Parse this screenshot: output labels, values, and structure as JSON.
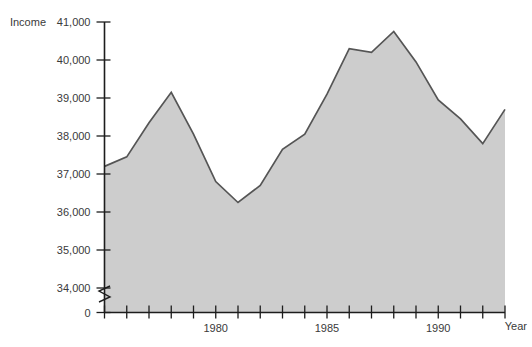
{
  "chart_data": {
    "type": "area",
    "title": "",
    "xlabel": "Year",
    "ylabel": "Income",
    "grid": false,
    "legend": "none",
    "ylim": [
      34000,
      41000
    ],
    "y_axis_break": true,
    "y_break_labels": [
      "0",
      "34,000"
    ],
    "yticks": [
      0,
      34000,
      35000,
      36000,
      37000,
      38000,
      39000,
      40000,
      41000
    ],
    "ytick_labels": [
      "0",
      "34,000",
      "35,000",
      "36,000",
      "37,000",
      "38,000",
      "39,000",
      "40,000",
      "41,000"
    ],
    "xlim": [
      1975,
      1993
    ],
    "xticks": [
      1975,
      1976,
      1977,
      1978,
      1979,
      1980,
      1981,
      1982,
      1983,
      1984,
      1985,
      1986,
      1987,
      1988,
      1989,
      1990,
      1991,
      1992,
      1993
    ],
    "xtick_labels": [
      "",
      "",
      "",
      "",
      "",
      "1980",
      "",
      "",
      "",
      "",
      "1985",
      "",
      "",
      "",
      "",
      "1990",
      "",
      "",
      ""
    ],
    "x": [
      1975,
      1976,
      1977,
      1978,
      1979,
      1980,
      1981,
      1982,
      1983,
      1984,
      1985,
      1986,
      1987,
      1988,
      1989,
      1990,
      1991,
      1992,
      1993
    ],
    "values": [
      37200,
      37450,
      38350,
      39150,
      38050,
      36800,
      36250,
      36700,
      37650,
      38050,
      39100,
      40300,
      40200,
      40750,
      39950,
      38950,
      38450,
      37800,
      38700
    ],
    "series": [
      {
        "name": "Income",
        "values": [
          37200,
          37450,
          38350,
          39150,
          38050,
          36800,
          36250,
          36700,
          37650,
          38050,
          39100,
          40300,
          40200,
          40750,
          39950,
          38950,
          38450,
          37800,
          38700
        ]
      }
    ],
    "colors": {
      "fill": "#cdcdcd",
      "line": "#555555",
      "axis": "#1d1d1d",
      "text": "#3a3a3a",
      "background": "#ffffff"
    }
  },
  "labels": {
    "income_axis_title": "Income",
    "year_axis_title": "Year"
  }
}
